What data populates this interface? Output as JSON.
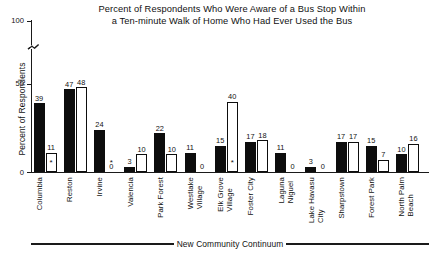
{
  "chart_data": {
    "type": "bar",
    "title": "Percent of Respondents Who Were Aware of a Bus Stop Within a Ten-minute Walk of Home Who Had Ever Used the Bus",
    "title_line1": "Percent of Respondents Who Were Aware of a Bus Stop Within",
    "title_line2": "a Ten-minute Walk of Home Who Had Ever Used the Bus",
    "xlabel": "New Community Continuum",
    "ylabel": "Percent of Respondents",
    "ylim": [
      0,
      100
    ],
    "yticks": [
      0,
      50,
      100
    ],
    "ytick_labels": [
      "0",
      "50",
      "100"
    ],
    "axis_break": true,
    "grid": false,
    "legend": "none",
    "categories": [
      "Columbia",
      "Reston",
      "Irvine",
      "Valencia",
      "Park Forest",
      "Westlake\nVillage",
      "Elk Grove\nVillage",
      "Foster City",
      "Laguna\nNiguel",
      "Lake Havasu\nCity",
      "Sharpstown",
      "Forest Park",
      "North Palm\nBeach"
    ],
    "series": [
      {
        "name": "series-black",
        "fill": "black",
        "values": [
          39,
          47,
          24,
          3,
          22,
          11,
          15,
          17,
          11,
          3,
          17,
          15,
          10
        ]
      },
      {
        "name": "series-white",
        "fill": "white",
        "values": [
          11,
          48,
          0,
          10,
          10,
          0,
          40,
          18,
          0,
          0,
          17,
          7,
          16
        ]
      }
    ],
    "annotations": [
      {
        "category": "Columbia",
        "series": "series-white",
        "marker": "*"
      },
      {
        "category": "Irvine",
        "series": "series-white",
        "marker": "*"
      },
      {
        "category": "Elk Grove Village",
        "series": "series-white",
        "marker": "*"
      }
    ],
    "colors": {
      "series_black": "#0d0d0d",
      "series_white": "#ffffff",
      "axis": "#1a1a1a",
      "background": "#ffffff",
      "text": "#111111"
    }
  }
}
